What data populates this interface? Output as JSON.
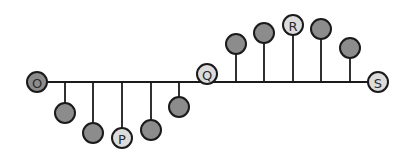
{
  "diagram": {
    "title": "",
    "colors": {
      "line": "#1a1a1a",
      "dark_ball": "#8c8c8c",
      "light_ball": "#dcdcdc",
      "label_text": "#2a2a2a"
    },
    "baseline": {
      "x1": 37,
      "x2": 378,
      "y": 82
    },
    "points": [
      {
        "id": "O",
        "label": "O",
        "x": 37,
        "y": 82,
        "stem": false,
        "fill": "dark"
      },
      {
        "id": "d1",
        "label": "",
        "x": 65,
        "y": 113,
        "stem": true,
        "fill": "dark"
      },
      {
        "id": "d2",
        "label": "",
        "x": 93,
        "y": 133,
        "stem": true,
        "fill": "dark"
      },
      {
        "id": "P",
        "label": "P",
        "x": 122,
        "y": 138,
        "stem": true,
        "fill": "light"
      },
      {
        "id": "d3",
        "label": "",
        "x": 151,
        "y": 130,
        "stem": true,
        "fill": "dark"
      },
      {
        "id": "d4",
        "label": "",
        "x": 179,
        "y": 107,
        "stem": true,
        "fill": "dark"
      },
      {
        "id": "Q",
        "label": "Q",
        "x": 207,
        "y": 74,
        "stem": false,
        "fill": "light"
      },
      {
        "id": "u1",
        "label": "",
        "x": 236,
        "y": 44,
        "stem": true,
        "fill": "dark"
      },
      {
        "id": "u2",
        "label": "",
        "x": 264,
        "y": 33,
        "stem": true,
        "fill": "dark"
      },
      {
        "id": "R",
        "label": "R",
        "x": 293,
        "y": 25,
        "stem": true,
        "fill": "light"
      },
      {
        "id": "u3",
        "label": "",
        "x": 321,
        "y": 29,
        "stem": true,
        "fill": "dark"
      },
      {
        "id": "u4",
        "label": "",
        "x": 350,
        "y": 48,
        "stem": true,
        "fill": "dark"
      },
      {
        "id": "S",
        "label": "S",
        "x": 378,
        "y": 82,
        "stem": false,
        "fill": "light"
      }
    ],
    "ball_radius": 10
  }
}
